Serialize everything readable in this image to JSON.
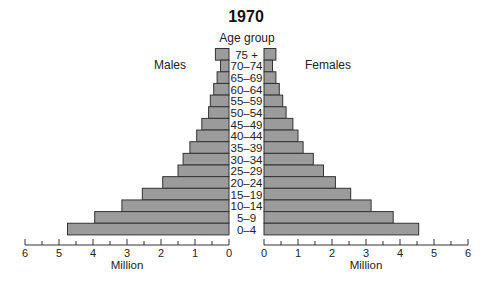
{
  "chart_data": {
    "type": "bar",
    "subtype": "population-pyramid",
    "title": "1970",
    "category_axis_label": "Age group",
    "categories": [
      "75 +",
      "70–74",
      "65–69",
      "60–64",
      "55–59",
      "50–54",
      "45–49",
      "40–44",
      "35–39",
      "30–34",
      "25–29",
      "20–24",
      "15–19",
      "10–14",
      "5–9",
      "0–4"
    ],
    "series": [
      {
        "name": "Males",
        "side": "left",
        "values": [
          0.4,
          0.25,
          0.35,
          0.45,
          0.55,
          0.6,
          0.8,
          0.95,
          1.15,
          1.35,
          1.5,
          1.95,
          2.55,
          3.15,
          3.95,
          4.75
        ]
      },
      {
        "name": "Females",
        "side": "right",
        "values": [
          0.35,
          0.25,
          0.35,
          0.45,
          0.55,
          0.65,
          0.85,
          1.0,
          1.15,
          1.45,
          1.75,
          2.1,
          2.55,
          3.15,
          3.8,
          4.55
        ]
      }
    ],
    "xlabel_left": "Million",
    "xlabel_right": "Million",
    "xlim": [
      0,
      6
    ],
    "x_ticks": [
      0,
      1,
      2,
      3,
      4,
      5,
      6
    ],
    "minor_tick_step": 0.5,
    "grid": false,
    "legend": "none (side labels)"
  },
  "labels": {
    "title": "1970",
    "age_header": "Age group",
    "males": "Males",
    "females": "Females",
    "unit": "Million"
  },
  "colors": {
    "bar_fill": "#9b9b9b",
    "bar_stroke": "#333333"
  }
}
